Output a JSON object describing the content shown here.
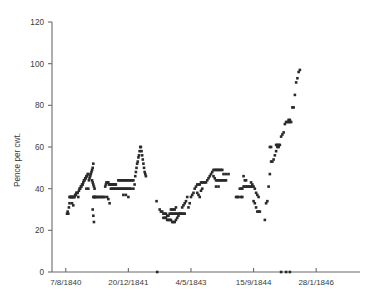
{
  "chart_data": {
    "type": "scatter",
    "title": "",
    "xlabel": "",
    "ylabel": "Pence per cwt.",
    "ylim": [
      0,
      120
    ],
    "yticks": [
      0,
      20,
      40,
      60,
      80,
      100,
      120
    ],
    "ytick_labels": [
      "0",
      "20",
      "40",
      "60",
      "80",
      "100",
      "120"
    ],
    "xtick_labels": [
      "7/8/1840",
      "20/12/1841",
      "4/5/1843",
      "15/9/1844",
      "28/1/1846"
    ],
    "xtick_positions": [
      0,
      100,
      200,
      300,
      400
    ],
    "xlim": [
      -22,
      470
    ],
    "grid": false,
    "legend": false,
    "marker": "square",
    "marker_color": "#2a2a2a",
    "series": [
      {
        "name": "Pence per cwt.",
        "points": [
          [
            2,
            28
          ],
          [
            3,
            29
          ],
          [
            4,
            28
          ],
          [
            5,
            31
          ],
          [
            6,
            33
          ],
          [
            6,
            36
          ],
          [
            7,
            36
          ],
          [
            8,
            36
          ],
          [
            9,
            36
          ],
          [
            10,
            36
          ],
          [
            11,
            36
          ],
          [
            12,
            36
          ],
          [
            13,
            36
          ],
          [
            14,
            36
          ],
          [
            10,
            33
          ],
          [
            12,
            32
          ],
          [
            15,
            37
          ],
          [
            16,
            37
          ],
          [
            17,
            38
          ],
          [
            18,
            38
          ],
          [
            19,
            38
          ],
          [
            20,
            36
          ],
          [
            21,
            39
          ],
          [
            22,
            40
          ],
          [
            23,
            40
          ],
          [
            24,
            41
          ],
          [
            25,
            41
          ],
          [
            26,
            42
          ],
          [
            27,
            42
          ],
          [
            28,
            43
          ],
          [
            29,
            44
          ],
          [
            30,
            44
          ],
          [
            31,
            45
          ],
          [
            32,
            45
          ],
          [
            33,
            46
          ],
          [
            34,
            46
          ],
          [
            35,
            47
          ],
          [
            36,
            47
          ],
          [
            33,
            40
          ],
          [
            36,
            40
          ],
          [
            37,
            44
          ],
          [
            38,
            45
          ],
          [
            39,
            46
          ],
          [
            40,
            47
          ],
          [
            41,
            48
          ],
          [
            42,
            49
          ],
          [
            43,
            50
          ],
          [
            44,
            52
          ],
          [
            42,
            44
          ],
          [
            43,
            43
          ],
          [
            44,
            42
          ],
          [
            45,
            41
          ],
          [
            46,
            40
          ],
          [
            44,
            36
          ],
          [
            45,
            36
          ],
          [
            46,
            36
          ],
          [
            47,
            36
          ],
          [
            48,
            36
          ],
          [
            43,
            30
          ],
          [
            44,
            27
          ],
          [
            45,
            24
          ],
          [
            50,
            36
          ],
          [
            52,
            36
          ],
          [
            54,
            36
          ],
          [
            56,
            36
          ],
          [
            58,
            36
          ],
          [
            60,
            36
          ],
          [
            62,
            36
          ],
          [
            63,
            41
          ],
          [
            64,
            42
          ],
          [
            65,
            43
          ],
          [
            66,
            43
          ],
          [
            67,
            43
          ],
          [
            68,
            43
          ],
          [
            69,
            42
          ],
          [
            70,
            42
          ],
          [
            71,
            42
          ],
          [
            72,
            42
          ],
          [
            73,
            42
          ],
          [
            74,
            42
          ],
          [
            75,
            42
          ],
          [
            76,
            42
          ],
          [
            77,
            42
          ],
          [
            78,
            42
          ],
          [
            79,
            42
          ],
          [
            80,
            42
          ],
          [
            66,
            36
          ],
          [
            68,
            35
          ],
          [
            70,
            33
          ],
          [
            72,
            40
          ],
          [
            74,
            40
          ],
          [
            76,
            40
          ],
          [
            78,
            40
          ],
          [
            80,
            40
          ],
          [
            82,
            40
          ],
          [
            84,
            40
          ],
          [
            86,
            40
          ],
          [
            88,
            40
          ],
          [
            90,
            40
          ],
          [
            92,
            40
          ],
          [
            94,
            40
          ],
          [
            96,
            40
          ],
          [
            98,
            40
          ],
          [
            100,
            40
          ],
          [
            102,
            40
          ],
          [
            104,
            40
          ],
          [
            84,
            44
          ],
          [
            86,
            44
          ],
          [
            88,
            44
          ],
          [
            90,
            44
          ],
          [
            92,
            44
          ],
          [
            94,
            44
          ],
          [
            96,
            44
          ],
          [
            98,
            44
          ],
          [
            100,
            44
          ],
          [
            102,
            44
          ],
          [
            104,
            44
          ],
          [
            106,
            44
          ],
          [
            108,
            44
          ],
          [
            92,
            37
          ],
          [
            96,
            37
          ],
          [
            100,
            36
          ],
          [
            108,
            40
          ],
          [
            110,
            42
          ],
          [
            111,
            46
          ],
          [
            112,
            48
          ],
          [
            113,
            50
          ],
          [
            114,
            52
          ],
          [
            115,
            53
          ],
          [
            116,
            55
          ],
          [
            117,
            56
          ],
          [
            118,
            58
          ],
          [
            119,
            60
          ],
          [
            120,
            60
          ],
          [
            121,
            58
          ],
          [
            122,
            56
          ],
          [
            123,
            54
          ],
          [
            124,
            52
          ],
          [
            125,
            50
          ],
          [
            126,
            48
          ],
          [
            127,
            47
          ],
          [
            128,
            46
          ],
          [
            145,
            34
          ],
          [
            150,
            30
          ],
          [
            152,
            29
          ],
          [
            154,
            29
          ],
          [
            156,
            28
          ],
          [
            158,
            28
          ],
          [
            160,
            28
          ],
          [
            162,
            27
          ],
          [
            164,
            27
          ],
          [
            166,
            28
          ],
          [
            168,
            28
          ],
          [
            170,
            28
          ],
          [
            172,
            28
          ],
          [
            174,
            28
          ],
          [
            176,
            28
          ],
          [
            178,
            28
          ],
          [
            180,
            28
          ],
          [
            182,
            28
          ],
          [
            184,
            28
          ],
          [
            186,
            28
          ],
          [
            188,
            28
          ],
          [
            190,
            28
          ],
          [
            156,
            26
          ],
          [
            158,
            26
          ],
          [
            160,
            26
          ],
          [
            162,
            25
          ],
          [
            164,
            25
          ],
          [
            166,
            25
          ],
          [
            168,
            25
          ],
          [
            170,
            24
          ],
          [
            172,
            24
          ],
          [
            174,
            24
          ],
          [
            176,
            25
          ],
          [
            178,
            26
          ],
          [
            180,
            27
          ],
          [
            182,
            28
          ],
          [
            168,
            30
          ],
          [
            170,
            30
          ],
          [
            172,
            30
          ],
          [
            174,
            30
          ],
          [
            176,
            31
          ],
          [
            186,
            31
          ],
          [
            188,
            32
          ],
          [
            190,
            33
          ],
          [
            192,
            34
          ],
          [
            194,
            36
          ],
          [
            196,
            31
          ],
          [
            198,
            33
          ],
          [
            200,
            36
          ],
          [
            202,
            37
          ],
          [
            204,
            38
          ],
          [
            206,
            40
          ],
          [
            208,
            41
          ],
          [
            210,
            42
          ],
          [
            212,
            42
          ],
          [
            214,
            42
          ],
          [
            216,
            43
          ],
          [
            218,
            43
          ],
          [
            220,
            43
          ],
          [
            222,
            43
          ],
          [
            224,
            43
          ],
          [
            210,
            38
          ],
          [
            212,
            37
          ],
          [
            214,
            36
          ],
          [
            216,
            39
          ],
          [
            218,
            40
          ],
          [
            226,
            44
          ],
          [
            228,
            45
          ],
          [
            230,
            46
          ],
          [
            232,
            47
          ],
          [
            234,
            48
          ],
          [
            236,
            49
          ],
          [
            238,
            49
          ],
          [
            240,
            49
          ],
          [
            242,
            49
          ],
          [
            244,
            49
          ],
          [
            246,
            49
          ],
          [
            248,
            49
          ],
          [
            250,
            49
          ],
          [
            236,
            46
          ],
          [
            238,
            45
          ],
          [
            240,
            44
          ],
          [
            242,
            44
          ],
          [
            244,
            44
          ],
          [
            246,
            44
          ],
          [
            248,
            44
          ],
          [
            250,
            44
          ],
          [
            252,
            44
          ],
          [
            254,
            44
          ],
          [
            256,
            44
          ],
          [
            240,
            41
          ],
          [
            244,
            41
          ],
          [
            252,
            47
          ],
          [
            256,
            47
          ],
          [
            260,
            47
          ],
          [
            272,
            36
          ],
          [
            274,
            36
          ],
          [
            276,
            36
          ],
          [
            278,
            40
          ],
          [
            280,
            40
          ],
          [
            282,
            40
          ],
          [
            284,
            41
          ],
          [
            286,
            41
          ],
          [
            288,
            41
          ],
          [
            290,
            41
          ],
          [
            292,
            41
          ],
          [
            294,
            41
          ],
          [
            296,
            41
          ],
          [
            298,
            41
          ],
          [
            286,
            44
          ],
          [
            288,
            44
          ],
          [
            284,
            46
          ],
          [
            280,
            36
          ],
          [
            282,
            36
          ],
          [
            296,
            43
          ],
          [
            298,
            42
          ],
          [
            300,
            41
          ],
          [
            302,
            40
          ],
          [
            304,
            38
          ],
          [
            306,
            37
          ],
          [
            308,
            36
          ],
          [
            300,
            34
          ],
          [
            302,
            33
          ],
          [
            304,
            31
          ],
          [
            306,
            29
          ],
          [
            308,
            29
          ],
          [
            310,
            29
          ],
          [
            318,
            25
          ],
          [
            320,
            33
          ],
          [
            322,
            34
          ],
          [
            324,
            41
          ],
          [
            326,
            47
          ],
          [
            328,
            53
          ],
          [
            330,
            53
          ],
          [
            332,
            54
          ],
          [
            334,
            56
          ],
          [
            336,
            58
          ],
          [
            338,
            60
          ],
          [
            340,
            60
          ],
          [
            342,
            61
          ],
          [
            336,
            61
          ],
          [
            338,
            61
          ],
          [
            340,
            61
          ],
          [
            326,
            60
          ],
          [
            328,
            60
          ],
          [
            344,
            65
          ],
          [
            346,
            66
          ],
          [
            348,
            67
          ],
          [
            350,
            71
          ],
          [
            352,
            72
          ],
          [
            354,
            72
          ],
          [
            356,
            72
          ],
          [
            358,
            72
          ],
          [
            360,
            72
          ],
          [
            356,
            73
          ],
          [
            358,
            73
          ],
          [
            362,
            79
          ],
          [
            364,
            79
          ],
          [
            366,
            85
          ],
          [
            368,
            91
          ],
          [
            370,
            93
          ],
          [
            372,
            96
          ],
          [
            374,
            97
          ],
          [
            146,
            0
          ],
          [
            344,
            0
          ],
          [
            352,
            0
          ],
          [
            358,
            0
          ]
        ]
      }
    ]
  }
}
